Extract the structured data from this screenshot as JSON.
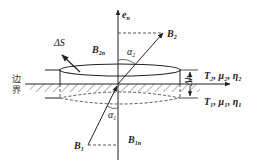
{
  "diagram": {
    "labels": {
      "normal_vector": "e",
      "normal_sub": "n",
      "b2": "B",
      "b2_sub": "2",
      "b2n": "B",
      "b2n_sub": "2n",
      "b1": "B",
      "b1_sub": "1",
      "b1n": "B",
      "b1n_sub": "1n",
      "alpha2": "α",
      "alpha2_sub": "2",
      "alpha1": "α",
      "alpha1_sub": "1",
      "delta_s": "ΔS",
      "delta_h": "Δh",
      "boundary_top": "边",
      "boundary_bottom": "界",
      "medium2": "T₂, μ₂, η₂",
      "medium1": "T₁, μ₁, η₁"
    },
    "colors": {
      "line": "#222222",
      "hatch": "#555555",
      "background": "#ffffff"
    }
  }
}
